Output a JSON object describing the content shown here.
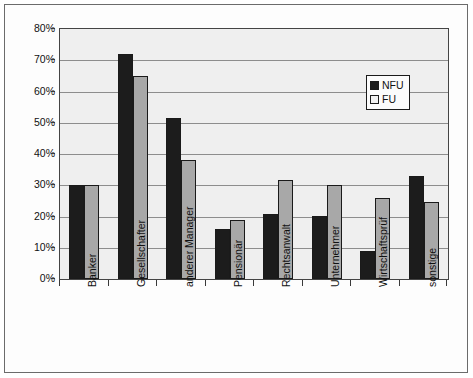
{
  "chart_data": {
    "type": "bar",
    "title": "",
    "xlabel": "",
    "ylabel": "",
    "ylim": [
      0,
      80
    ],
    "ytick_labels": [
      "80%",
      "70%",
      "60%",
      "50%",
      "40%",
      "30%",
      "20%",
      "10%",
      "0%"
    ],
    "ytick_values": [
      80,
      70,
      60,
      50,
      40,
      30,
      20,
      10,
      0
    ],
    "grid": true,
    "legend_position": "top-right",
    "categories": [
      "Banker",
      "Gesellschafter",
      "anderer Manager",
      "Pensionär",
      "Rechtsanwalt",
      "Unternehmer",
      "Wirtschaftsprüf",
      "sonstige"
    ],
    "series": [
      {
        "name": "NFU",
        "color": "#1c1c1c",
        "values": [
          30,
          72,
          51.5,
          16,
          20.7,
          20,
          9,
          33
        ]
      },
      {
        "name": "FU",
        "color": "#a8a8a8",
        "values": [
          30,
          65,
          38,
          19,
          31.7,
          30,
          26,
          24.5
        ]
      }
    ]
  },
  "legend": {
    "items": [
      {
        "label": "NFU",
        "swatch": "black-square-swatch"
      },
      {
        "label": "FU",
        "swatch": "white-square-swatch"
      }
    ]
  }
}
